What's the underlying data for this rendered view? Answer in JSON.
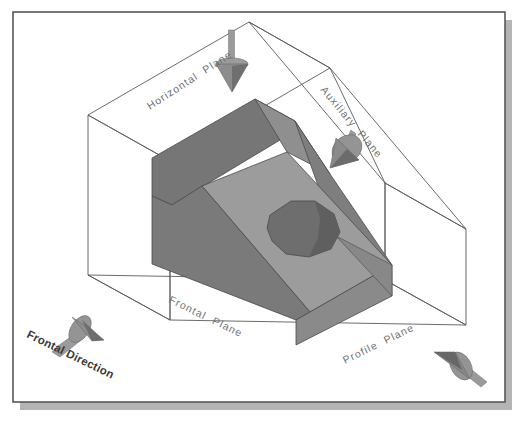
{
  "figure": {
    "frame": {
      "border_color": "#585858",
      "background_color": "#ffffff",
      "shadow_color": "#b4b4b4"
    },
    "glass_box": {
      "line_color": "#5a5a5a",
      "face_color": "#ffffff",
      "description": "transparent wireframe projection box"
    },
    "solid": {
      "name": "inclined-wedge-block-with-hole",
      "colors": {
        "dark_face": "#767676",
        "left_face": "#7e7e7e",
        "top_inclined_face": "#9c9c9c",
        "front_face": "#8a8a8a",
        "right_face": "#888888",
        "hole_interior": "#6e6e6e",
        "edge_color": "#4a4a4a"
      }
    },
    "labels": [
      {
        "id": "horizontal-plane",
        "text": "Horizontal  Plane",
        "x": 150,
        "y": 110,
        "rotation": -33,
        "style": "plane"
      },
      {
        "id": "auxiliary-plane",
        "text": "Auxiliary  Plane",
        "x": 320,
        "y": 90,
        "rotation": 50,
        "style": "plane"
      },
      {
        "id": "frontal-plane",
        "text": "Frontal  Plane",
        "x": 168,
        "y": 302,
        "rotation": 26,
        "style": "plane"
      },
      {
        "id": "profile-plane",
        "text": "Profile  Plane",
        "x": 345,
        "y": 364,
        "rotation": -26,
        "style": "plane"
      },
      {
        "id": "frontal-direction",
        "text": "Frontal Direction",
        "x": 26,
        "y": 337,
        "rotation": 26,
        "style": "direction"
      }
    ],
    "arrows": [
      {
        "id": "horizontal-direction-arrow",
        "name": "arrow-down-cone",
        "tip_x": 232,
        "tip_y": 92,
        "base_x": 232,
        "base_y": 62,
        "shaft_end_x": 232,
        "shaft_end_y": 30,
        "cone_color": "#8d8d8d",
        "cone_shade": "#6a6a6a",
        "shaft_color": "#9a9a9a"
      },
      {
        "id": "auxiliary-direction-arrow",
        "name": "arrow-down-left-cone",
        "tip_x": 330,
        "tip_y": 168,
        "base_x": 348,
        "base_y": 146,
        "shaft_end_x": 369,
        "shaft_end_y": 122,
        "cone_color": "#8d8d8d",
        "cone_shade": "#6a6a6a",
        "shaft_color": "#9a9a9a"
      },
      {
        "id": "frontal-direction-arrow",
        "name": "arrow-right-cone",
        "tip_x": 104,
        "tip_y": 340,
        "base_x": 76,
        "base_y": 322,
        "shaft_end_x": 52,
        "shaft_end_y": 352,
        "cone_color": "#8d8d8d",
        "cone_shade": "#6a6a6a",
        "shaft_color": "#9a9a9a"
      },
      {
        "id": "profile-direction-arrow",
        "name": "arrow-left-cone",
        "tip_x": 434,
        "tip_y": 352,
        "base_x": 464,
        "base_y": 366,
        "shaft_end_x": 487,
        "shaft_end_y": 382,
        "cone_color": "#8d8d8d",
        "cone_shade": "#6a6a6a",
        "shaft_color": "#9a9a9a"
      }
    ]
  }
}
